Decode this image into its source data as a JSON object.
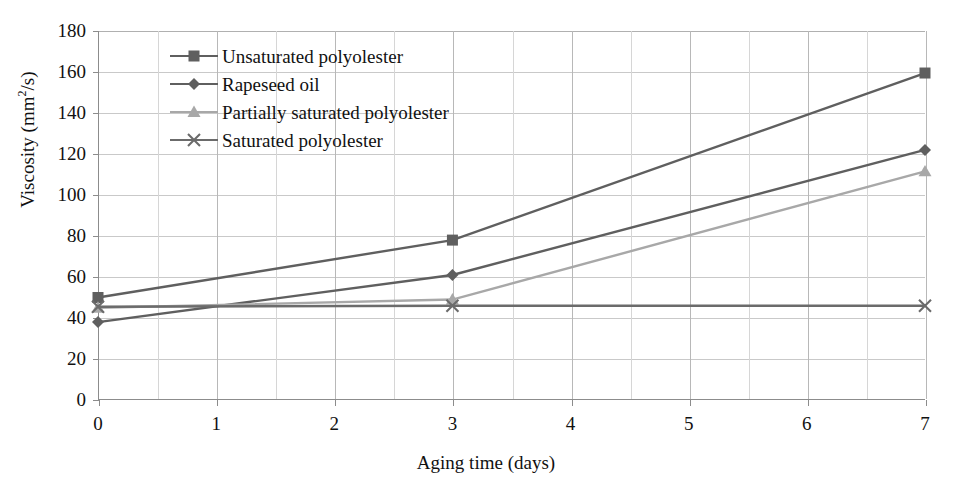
{
  "chart_data": {
    "type": "line",
    "title": "",
    "xlabel": "Aging time (days)",
    "ylabel": "Viscosity (mm2/s)",
    "ylabel_base": "Viscosity (mm",
    "ylabel_sup": "2",
    "ylabel_tail": "/s)",
    "x": [
      0,
      3,
      7
    ],
    "xlim": [
      0,
      7
    ],
    "ylim": [
      0,
      180
    ],
    "xticks": [
      "0",
      "1",
      "2",
      "3",
      "4",
      "5",
      "6",
      "7"
    ],
    "yticks": [
      "0",
      "20",
      "40",
      "60",
      "80",
      "100",
      "120",
      "140",
      "160",
      "180"
    ],
    "grid": "both",
    "legend_position": "upper-left-inside",
    "series": [
      {
        "name": "Unsaturated polyolester",
        "marker": "square",
        "color": "#5f5f5f",
        "values": [
          50,
          78,
          159.5
        ]
      },
      {
        "name": "Rapeseed oil",
        "marker": "diamond",
        "color": "#5f5f5f",
        "values": [
          38,
          61,
          122
        ]
      },
      {
        "name": "Partially saturated polyolester",
        "marker": "triangle",
        "color": "#a8a8a8",
        "values": [
          45,
          49,
          111.5
        ]
      },
      {
        "name": "Saturated polyolester",
        "marker": "cross",
        "color": "#6b6b6b",
        "values": [
          45.5,
          46,
          46
        ]
      }
    ]
  },
  "colors": {
    "grid": "#c9c9c9",
    "axis": "#8c8c8c",
    "text": "#111111",
    "series_dark": "#5f5f5f",
    "series_light": "#a8a8a8",
    "background": "#ffffff"
  }
}
